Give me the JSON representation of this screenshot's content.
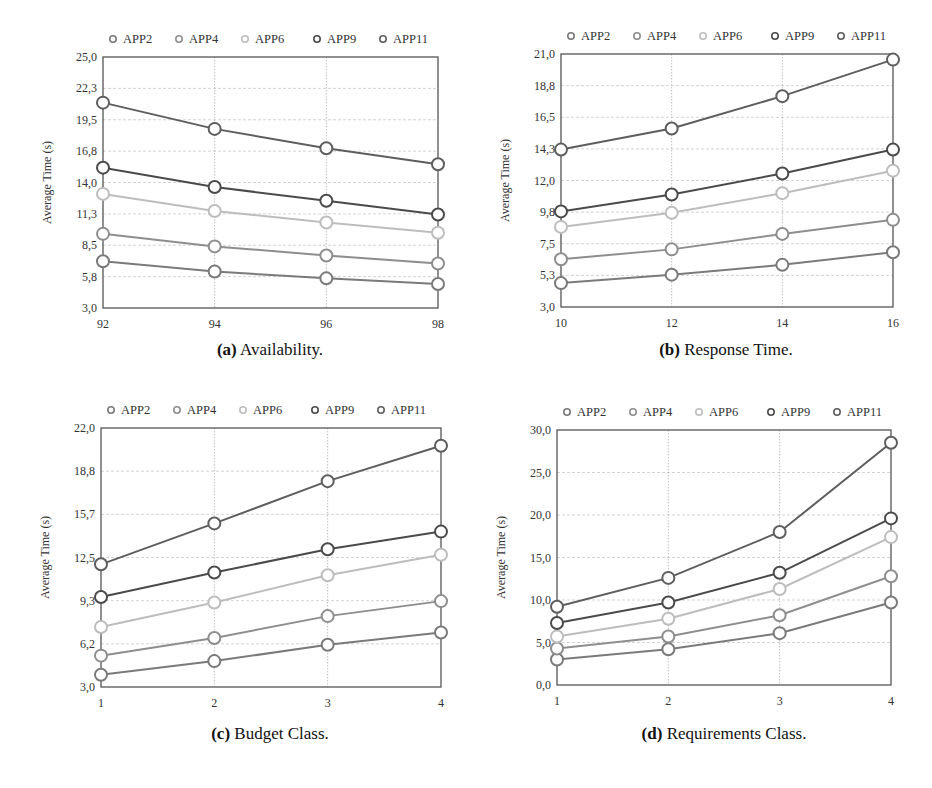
{
  "figure": {
    "captions": [
      {
        "label": "(a)",
        "text": "Availability."
      },
      {
        "label": "(b)",
        "text": "Response Time."
      },
      {
        "label": "(c)",
        "text": "Budget Class."
      },
      {
        "label": "(d)",
        "text": "Requirements Class."
      }
    ]
  },
  "colors": {
    "APP2": "#7a7a7a",
    "APP4": "#8e8e8e",
    "APP6": "#bdbdbd",
    "APP9": "#4a4a4a",
    "APP11": "#5e5e5e"
  },
  "chart_data": [
    {
      "type": "line",
      "title": "(a) Availability.",
      "xlabel": "",
      "ylabel": "Average Time (s)",
      "x": [
        92,
        94,
        96,
        98
      ],
      "yticks": [
        "3,0",
        "5,8",
        "8,5",
        "11,3",
        "14,0",
        "16,8",
        "19,5",
        "22,3",
        "25,0"
      ],
      "ylim": [
        3.0,
        25.0
      ],
      "grid": true,
      "legend_position": "top",
      "series": [
        {
          "name": "APP2",
          "values": [
            7.1,
            6.2,
            5.6,
            5.1
          ]
        },
        {
          "name": "APP4",
          "values": [
            9.5,
            8.4,
            7.6,
            6.9
          ]
        },
        {
          "name": "APP6",
          "values": [
            13.0,
            11.5,
            10.5,
            9.6
          ]
        },
        {
          "name": "APP9",
          "values": [
            15.3,
            13.6,
            12.4,
            11.2
          ]
        },
        {
          "name": "APP11",
          "values": [
            21.0,
            18.7,
            17.0,
            15.6
          ]
        }
      ]
    },
    {
      "type": "line",
      "title": "(b) Response Time.",
      "xlabel": "",
      "ylabel": "Average Time (s)",
      "x": [
        10,
        12,
        14,
        16
      ],
      "yticks": [
        "3,0",
        "5,3",
        "7,5",
        "9,8",
        "12,0",
        "14,3",
        "16,5",
        "18,8",
        "21,0"
      ],
      "ylim": [
        3.0,
        21.0
      ],
      "grid": true,
      "legend_position": "top",
      "series": [
        {
          "name": "APP2",
          "values": [
            4.7,
            5.3,
            6.0,
            6.9
          ]
        },
        {
          "name": "APP4",
          "values": [
            6.4,
            7.1,
            8.2,
            9.2
          ]
        },
        {
          "name": "APP6",
          "values": [
            8.7,
            9.7,
            11.1,
            12.7
          ]
        },
        {
          "name": "APP9",
          "values": [
            9.8,
            11.0,
            12.5,
            14.2
          ]
        },
        {
          "name": "APP11",
          "values": [
            14.2,
            15.7,
            18.0,
            20.6
          ]
        }
      ]
    },
    {
      "type": "line",
      "title": "(c) Budget Class.",
      "xlabel": "",
      "ylabel": "Average Time (s)",
      "x": [
        1,
        2,
        3,
        4
      ],
      "yticks": [
        "3,0",
        "6,2",
        "9,3",
        "12,5",
        "15,7",
        "18,8",
        "22,0"
      ],
      "ylim": [
        3.0,
        22.0
      ],
      "grid": true,
      "legend_position": "top",
      "series": [
        {
          "name": "APP2",
          "values": [
            3.9,
            4.9,
            6.1,
            7.0
          ]
        },
        {
          "name": "APP4",
          "values": [
            5.3,
            6.6,
            8.2,
            9.3
          ]
        },
        {
          "name": "APP6",
          "values": [
            7.4,
            9.2,
            11.2,
            12.7
          ]
        },
        {
          "name": "APP9",
          "values": [
            9.6,
            11.4,
            13.1,
            14.4
          ]
        },
        {
          "name": "APP11",
          "values": [
            12.0,
            15.0,
            18.1,
            20.7
          ]
        }
      ]
    },
    {
      "type": "line",
      "title": "(d) Requirements Class.",
      "xlabel": "",
      "ylabel": "Average Time (s)",
      "x": [
        1,
        2,
        3,
        4
      ],
      "yticks": [
        "0,0",
        "5,0",
        "10,0",
        "15,0",
        "20,0",
        "25,0",
        "30,0"
      ],
      "ylim": [
        0.0,
        30.0
      ],
      "grid": true,
      "legend_position": "top",
      "series": [
        {
          "name": "APP2",
          "values": [
            3.0,
            4.2,
            6.1,
            9.7
          ]
        },
        {
          "name": "APP4",
          "values": [
            4.3,
            5.7,
            8.2,
            12.8
          ]
        },
        {
          "name": "APP6",
          "values": [
            5.7,
            7.8,
            11.3,
            17.4
          ]
        },
        {
          "name": "APP9",
          "values": [
            7.3,
            9.7,
            13.2,
            19.6
          ]
        },
        {
          "name": "APP11",
          "values": [
            9.2,
            12.6,
            18.0,
            28.5
          ]
        }
      ]
    }
  ]
}
